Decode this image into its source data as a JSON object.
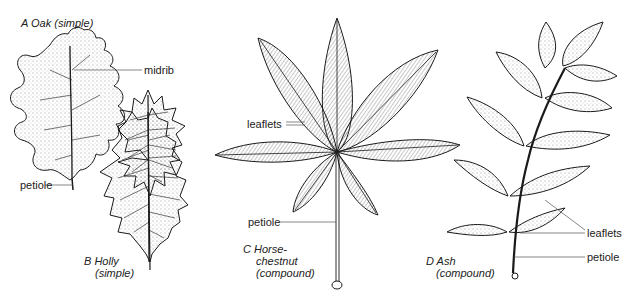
{
  "figure": {
    "panels": [
      {
        "letter": "A",
        "name": "Oak",
        "type": "(simple)",
        "caption_lines": [
          "A  Oak (simple)"
        ]
      },
      {
        "letter": "B",
        "name": "Holly",
        "type": "(simple)",
        "caption_lines": [
          "B  Holly",
          "(simple)"
        ]
      },
      {
        "letter": "C",
        "name": "Horse-chestnut",
        "type": "(compound)",
        "caption_lines": [
          "C  Horse-",
          "chestnut",
          "(compound)"
        ]
      },
      {
        "letter": "D",
        "name": "Ash",
        "type": "(compound)",
        "caption_lines": [
          "D  Ash",
          "(compound)"
        ]
      }
    ],
    "labels": {
      "oak_midrib": "midrib",
      "oak_petiole": "petiole",
      "horse_leaflets": "leaflets",
      "horse_petiole": "petiole",
      "ash_leaflets": "leaflets",
      "ash_petiole": "petiole"
    },
    "colors": {
      "ink": "#1a1a1a",
      "leader": "#555555",
      "background": "#ffffff"
    }
  }
}
